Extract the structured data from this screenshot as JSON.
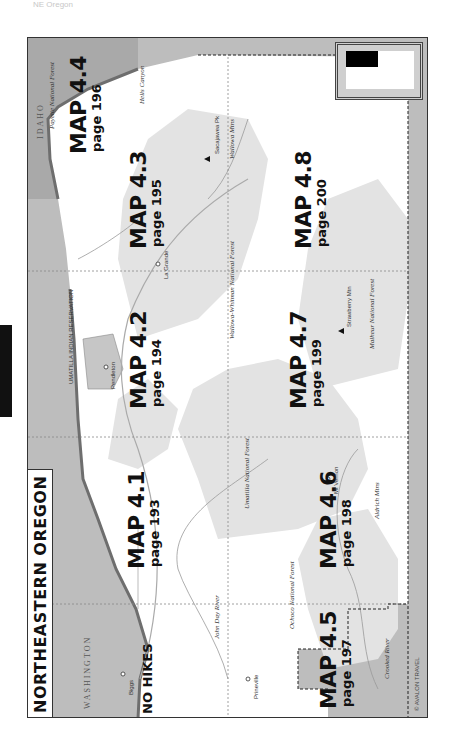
{
  "page": {
    "header": "NE Oregon",
    "side_tab": ""
  },
  "map": {
    "title": "NORTHEASTERN OREGON",
    "copyright": "© AVALON TRAVEL",
    "no_hikes_label": "NO HIKES",
    "regions": [
      {
        "map": "MAP 4.1",
        "page": "page 193"
      },
      {
        "map": "MAP 4.2",
        "page": "page 194"
      },
      {
        "map": "MAP 4.3",
        "page": "page 195"
      },
      {
        "map": "MAP 4.4",
        "page": "page 196"
      },
      {
        "map": "MAP 4.5",
        "page": "page 197"
      },
      {
        "map": "MAP 4.6",
        "page": "page 198"
      },
      {
        "map": "MAP 4.7",
        "page": "page 199"
      },
      {
        "map": "MAP 4.8",
        "page": "page 200"
      }
    ],
    "states": {
      "washington": "WASHINGTON",
      "idaho": "IDAHO"
    },
    "towns": [
      "Biggs",
      "Pendleton",
      "La Grande",
      "Mt Vernon",
      "Prineville"
    ],
    "rivers": [
      "Columbia River",
      "John Day River",
      "Crooked River",
      "Walla Walla River",
      "Umatilla River",
      "Grande Ronde River",
      "Powder River",
      "Snake River",
      "Imnaha River"
    ],
    "forests": [
      "Umatilla National Forest",
      "Wallowa-Whitman National Forest",
      "Malheur National Forest",
      "Ochoco National Forest",
      "Payette National Forest"
    ],
    "other_labels": {
      "reservation": "UMATILLA INDIAN RESERVATION",
      "wallowa_mtns": "Wallowa Mtns",
      "blue_mtns": "Blue Mountains",
      "aldrich_mtns": "Aldrich Mtns",
      "hells_canyon": "Hells Canyon",
      "seven_devils": "Seven Devils",
      "sacajawea": "Sacajawea Pk",
      "sacajawea_elev": "9,838 ft",
      "strawberry": "Strawberry Mtn",
      "strawberry_elev": "9,038 ft",
      "prineville_res": "Prineville Reservoir",
      "mt_vernon": "Mt Vernon"
    },
    "highways": [
      "84",
      "97",
      "395",
      "26",
      "19",
      "30",
      "82",
      "126"
    ],
    "scale": {
      "mi": "20 mi",
      "km": "20 km",
      "zero": "0"
    },
    "colors": {
      "outside": "#b9b9b9",
      "forest": "#e4e4e4",
      "water": "#888888",
      "land": "#ffffff",
      "text": "#111111"
    }
  }
}
